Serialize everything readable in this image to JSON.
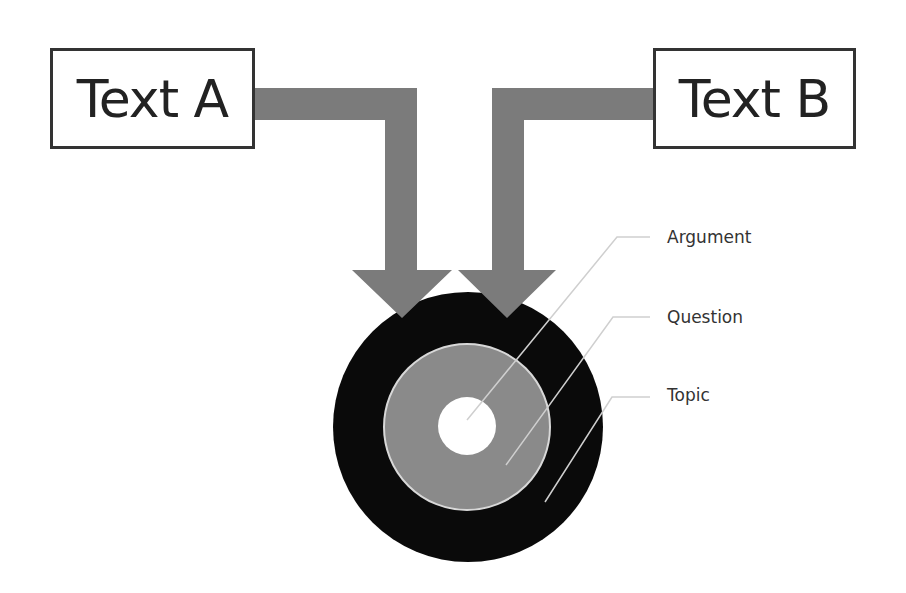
{
  "boxes": {
    "left": {
      "label": "Text A"
    },
    "right": {
      "label": "Text B"
    }
  },
  "target": {
    "layers": [
      {
        "label": "Argument",
        "ring": "inner",
        "color": "#ffffff"
      },
      {
        "label": "Question",
        "ring": "middle",
        "color": "#8a8a8a"
      },
      {
        "label": "Topic",
        "ring": "outer",
        "color": "#0a0a0a"
      }
    ]
  },
  "colors": {
    "arrow": "#7b7b7b",
    "outer_ring": "#0a0a0a",
    "middle_ring": "#8a8a8a",
    "inner_ring": "#ffffff",
    "leader_line": "#cfcfcf",
    "box_border": "#333333"
  }
}
